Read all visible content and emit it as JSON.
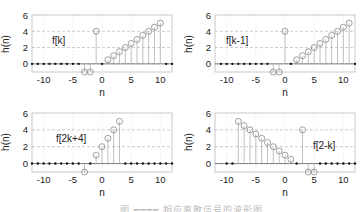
{
  "figure": {
    "caption": "图 ━━━━ 相应离散信号的波形图",
    "colors": {
      "axis": "#555555",
      "grid": "#aaaaaa",
      "stem": "#999999",
      "marker": "#888888",
      "dot": "#111111",
      "text": "#222222"
    }
  },
  "chart_data": [
    {
      "type": "stem",
      "panel": "top-left",
      "title": "",
      "annotation": "f[k]",
      "xlabel": "n",
      "ylabel": "h(n)",
      "xlim": [
        -12,
        12
      ],
      "ylim": [
        -1,
        6
      ],
      "xticks": [
        -10,
        -5,
        0,
        5,
        10
      ],
      "yticks": [
        0,
        2,
        4,
        6
      ],
      "grid": true,
      "x": [
        -12,
        -11,
        -10,
        -9,
        -8,
        -7,
        -6,
        -5,
        -4,
        -3,
        -2,
        -1,
        0,
        1,
        2,
        3,
        4,
        5,
        6,
        7,
        8,
        9,
        10,
        11,
        12
      ],
      "values": [
        0,
        0,
        0,
        0,
        0,
        0,
        0,
        0,
        0,
        -1,
        -1,
        4,
        0,
        0.5,
        1,
        1.5,
        2,
        2.5,
        3,
        3.5,
        4,
        4.5,
        5,
        0,
        0
      ]
    },
    {
      "type": "stem",
      "panel": "top-right",
      "title": "",
      "annotation": "f[k-1]",
      "xlabel": "n",
      "ylabel": "h(n)",
      "xlim": [
        -12,
        12
      ],
      "ylim": [
        -1,
        6
      ],
      "xticks": [
        -10,
        -5,
        0,
        5,
        10
      ],
      "yticks": [
        0,
        2,
        4,
        6
      ],
      "grid": true,
      "x": [
        -11,
        -10,
        -9,
        -8,
        -7,
        -6,
        -5,
        -4,
        -3,
        -2,
        -1,
        0,
        1,
        2,
        3,
        4,
        5,
        6,
        7,
        8,
        9,
        10,
        11,
        12
      ],
      "values": [
        0,
        0,
        0,
        0,
        0,
        0,
        0,
        0,
        0,
        -1,
        -1,
        4,
        0,
        0.5,
        1,
        1.5,
        2,
        2.5,
        3,
        3.5,
        4,
        4.5,
        5,
        0
      ]
    },
    {
      "type": "stem",
      "panel": "bottom-left",
      "title": "",
      "annotation": "f[2k+4]",
      "xlabel": "n",
      "ylabel": "h(n)",
      "xlim": [
        -12,
        12
      ],
      "ylim": [
        -1,
        6
      ],
      "xticks": [
        -10,
        -5,
        0,
        5,
        10
      ],
      "yticks": [
        0,
        2,
        4,
        6
      ],
      "grid": true,
      "x": [
        -12,
        -11,
        -10,
        -9,
        -8,
        -7,
        -6,
        -5,
        -4,
        -3,
        -2,
        -1,
        0,
        1,
        2,
        3,
        4,
        5,
        6,
        7,
        8,
        9,
        10,
        11,
        12
      ],
      "values": [
        0,
        0,
        0,
        0,
        0,
        0,
        0,
        0,
        0,
        -1,
        0,
        1,
        2,
        3,
        4,
        5,
        0,
        0,
        0,
        0,
        0,
        0,
        0,
        0,
        0
      ]
    },
    {
      "type": "stem",
      "panel": "bottom-right",
      "title": "",
      "annotation": "f[2-k]",
      "xlabel": "n",
      "ylabel": "h(n)",
      "xlim": [
        -11,
        12
      ],
      "ylim": [
        -1,
        6
      ],
      "xticks": [
        -10,
        -5,
        0,
        5,
        10
      ],
      "yticks": [
        0,
        2,
        4,
        6
      ],
      "grid": true,
      "x": [
        -10,
        -9,
        -8,
        -7,
        -6,
        -5,
        -4,
        -3,
        -2,
        -1,
        0,
        1,
        2,
        3,
        4,
        5,
        6,
        7,
        8,
        9,
        10,
        11,
        12
      ],
      "values": [
        0,
        0,
        5,
        4.5,
        4,
        3.5,
        3,
        2.5,
        2,
        1.5,
        1,
        0.5,
        0,
        4,
        -1,
        -1,
        0,
        0,
        0,
        0,
        0,
        0,
        0
      ]
    }
  ]
}
